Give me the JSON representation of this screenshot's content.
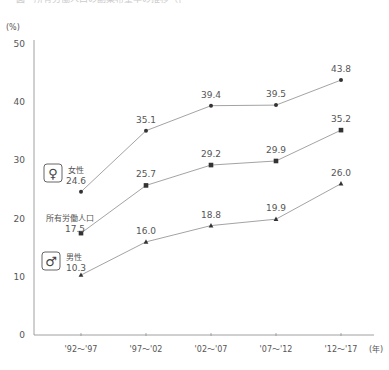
{
  "caption": "図　所有労働人口の副業希望率の推移（性別）",
  "chart_data": {
    "type": "line",
    "title": "",
    "ylabel": "(%)",
    "xlabel": "(年)",
    "ylim": [
      0,
      50
    ],
    "yticks": [
      0,
      10,
      20,
      30,
      40,
      50
    ],
    "categories": [
      "'92～'97",
      "'97～'02",
      "'02～'07",
      "'07～'12",
      "'12～'17"
    ],
    "x_unit": "(年)",
    "grid": false,
    "legend_position": "inline-left",
    "series": [
      {
        "name": "女性",
        "icon": "female-icon",
        "marker": "circle",
        "values": [
          24.6,
          35.1,
          39.4,
          39.5,
          43.8
        ]
      },
      {
        "name": "所有労働人口",
        "icon": "",
        "marker": "square",
        "values": [
          17.5,
          25.7,
          29.2,
          29.9,
          35.2
        ]
      },
      {
        "name": "男性",
        "icon": "male-icon",
        "marker": "triangle",
        "values": [
          10.3,
          16.0,
          18.8,
          19.9,
          26.0
        ]
      }
    ]
  },
  "colors": {
    "axis": "#888888",
    "line": "#999999",
    "marker": "#333333",
    "text": "#555555"
  }
}
